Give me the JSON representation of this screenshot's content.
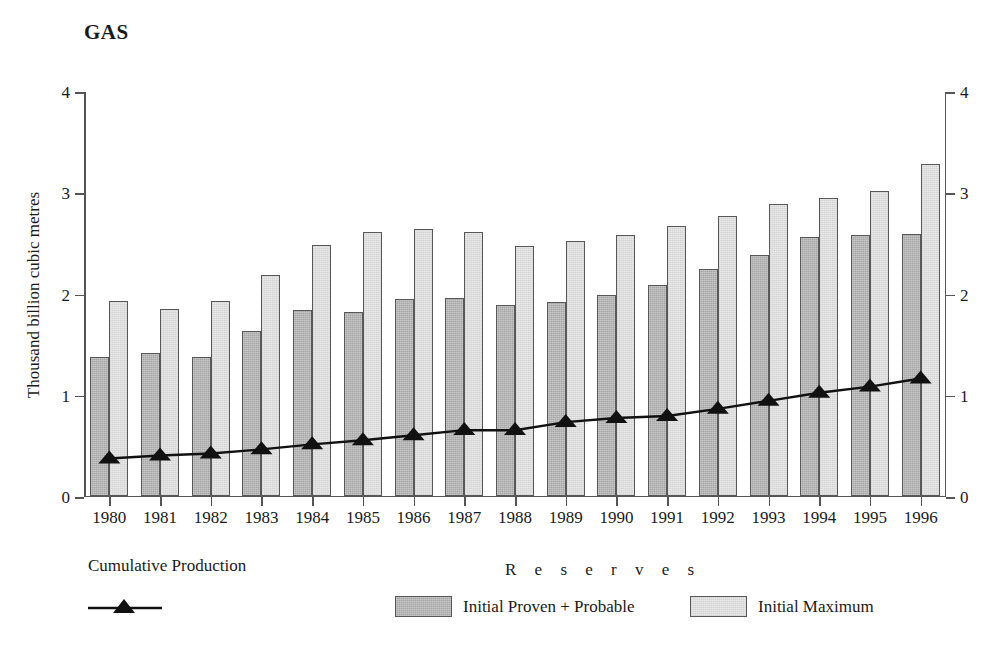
{
  "chart_data": {
    "type": "bar",
    "title": "GAS",
    "xlabel": "",
    "ylabel": "Thousand billion cubic metres",
    "ylim": [
      0,
      4
    ],
    "yticks": [
      0,
      1,
      2,
      3,
      4
    ],
    "ytick_labels": [
      "0",
      "1",
      "2",
      "3",
      "4"
    ],
    "right_axis": {
      "ylim": [
        0,
        4
      ],
      "yticks": [
        0,
        1,
        2,
        3,
        4
      ],
      "ytick_labels": [
        "0",
        "1",
        "2",
        "3",
        "4"
      ]
    },
    "grid": false,
    "legend_position": "bottom",
    "categories": [
      "1980",
      "1981",
      "1982",
      "1983",
      "1984",
      "1985",
      "1986",
      "1987",
      "1988",
      "1989",
      "1990",
      "1991",
      "1992",
      "1993",
      "1994",
      "1995",
      "1996"
    ],
    "series": [
      {
        "name": "Initial Proven + Probable",
        "type": "bar",
        "color": "#a6a6a6",
        "values": [
          1.37,
          1.41,
          1.37,
          1.62,
          1.83,
          1.81,
          1.94,
          1.95,
          1.88,
          1.91,
          1.98,
          2.08,
          2.24,
          2.38,
          2.55,
          2.57,
          2.58
        ]
      },
      {
        "name": "Initial Maximum",
        "type": "bar",
        "color": "#e9e9e9",
        "values": [
          1.92,
          1.84,
          1.92,
          2.18,
          2.47,
          2.6,
          2.63,
          2.6,
          2.46,
          2.51,
          2.57,
          2.66,
          2.76,
          2.88,
          2.94,
          3.01,
          3.27
        ]
      },
      {
        "name": "Cumulative Production",
        "type": "line",
        "color": "#111111",
        "marker": "triangle",
        "values": [
          0.38,
          0.41,
          0.43,
          0.47,
          0.52,
          0.56,
          0.61,
          0.66,
          0.66,
          0.74,
          0.78,
          0.8,
          0.87,
          0.95,
          1.03,
          1.09,
          1.17
        ]
      }
    ]
  },
  "legend": {
    "cumulative_label": "Cumulative Production",
    "reserves_label": "R e s e r v e s",
    "proven_label": "Initial Proven + Probable",
    "maximum_label": "Initial Maximum"
  }
}
